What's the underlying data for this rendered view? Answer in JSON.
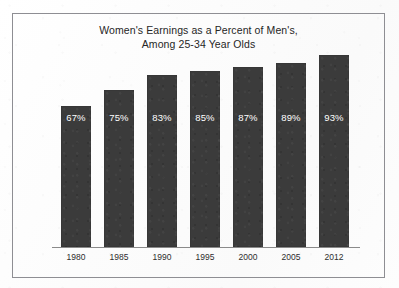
{
  "figure": {
    "background_color": "#fdfdfd",
    "frame_border_color": "#8e8e93",
    "title_line_1": "Women's Earnings as a Percent of Men's,",
    "title_line_2": "Among 25-34 Year Olds"
  },
  "chart_data": {
    "type": "bar",
    "title": "Women's Earnings as a Percent of Men's, Among 25-34 Year Olds",
    "subtitle": "",
    "xlabel": "",
    "ylabel": "",
    "categories": [
      "1980",
      "1985",
      "1990",
      "1995",
      "2000",
      "2005",
      "2012"
    ],
    "values": [
      67,
      75,
      83,
      85,
      87,
      89,
      93
    ],
    "data_labels": [
      "67%",
      "75%",
      "83%",
      "85%",
      "87%",
      "89%",
      "93%"
    ],
    "ylim": [
      0,
      100
    ],
    "grid": false,
    "legend": "none",
    "bar_color": "#3b3b3b",
    "data_label_color": "#ffffff",
    "axis_line_color": "#8a8a8a",
    "tick_label_color": "#2e2e2e"
  }
}
